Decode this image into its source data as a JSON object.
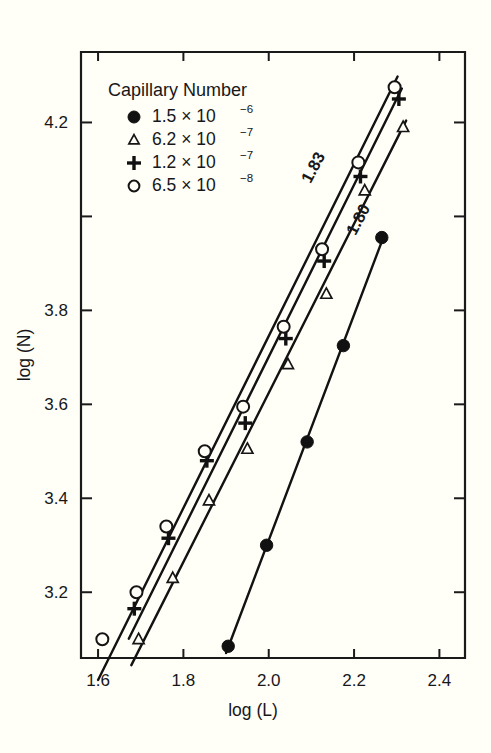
{
  "figure": {
    "background_color": "#fffef7",
    "ink_color": "#111111"
  },
  "legend": {
    "title": "Capillary Number",
    "position": "upper-left-inside",
    "entries": [
      {
        "marker": "filled-circle",
        "mantissa": "1.5 × 10",
        "exponent": "−6",
        "value": 1.5e-06
      },
      {
        "marker": "open-triangle",
        "mantissa": "6.2 × 10",
        "exponent": "−7",
        "value": 6.2e-07
      },
      {
        "marker": "plus",
        "mantissa": "1.2 × 10",
        "exponent": "−7",
        "value": 1.2e-07
      },
      {
        "marker": "open-circle",
        "mantissa": "6.5 × 10",
        "exponent": "−8",
        "value": 6.5e-08
      }
    ]
  },
  "annotations": [
    {
      "name": "slope-label-upper",
      "text": "1.83",
      "rotation_deg": -62
    },
    {
      "name": "slope-label-lower",
      "text": "1.80",
      "rotation_deg": -62
    }
  ],
  "chart_data": {
    "type": "scatter",
    "title": "",
    "xlabel": "log (L)",
    "ylabel": "log (N)",
    "xlim": [
      1.56,
      2.46
    ],
    "ylim": [
      3.06,
      4.35
    ],
    "xticks": [
      1.6,
      1.8,
      2.0,
      2.2,
      2.4
    ],
    "xticklabels": [
      "1.6",
      "1.8",
      "2.0",
      "2.2",
      "2.4"
    ],
    "yticks": [
      3.2,
      3.4,
      3.6,
      3.8,
      4.0,
      4.2
    ],
    "yticklabels": [
      "3.2",
      "3.4",
      "3.6",
      "3.8",
      "",
      "4.2"
    ],
    "grid": false,
    "legend_position": "upper left",
    "series": [
      {
        "name": "1.5 × 10−6",
        "marker": "filled-circle",
        "fit_slope": null,
        "points": [
          {
            "x": 1.905,
            "y": 3.085
          },
          {
            "x": 1.995,
            "y": 3.3
          },
          {
            "x": 2.09,
            "y": 3.52
          },
          {
            "x": 2.175,
            "y": 3.725
          },
          {
            "x": 2.265,
            "y": 3.955
          }
        ]
      },
      {
        "name": "6.2 × 10−7",
        "marker": "open-triangle",
        "fit_slope": 1.8,
        "points": [
          {
            "x": 1.695,
            "y": 3.1
          },
          {
            "x": 1.775,
            "y": 3.23
          },
          {
            "x": 1.86,
            "y": 3.395
          },
          {
            "x": 1.95,
            "y": 3.505
          },
          {
            "x": 2.045,
            "y": 3.685
          },
          {
            "x": 2.135,
            "y": 3.835
          },
          {
            "x": 2.225,
            "y": 4.055
          },
          {
            "x": 2.315,
            "y": 4.19
          }
        ]
      },
      {
        "name": "1.2 × 10−7",
        "marker": "plus",
        "fit_slope": 1.83,
        "points": [
          {
            "x": 1.685,
            "y": 3.165
          },
          {
            "x": 1.765,
            "y": 3.315
          },
          {
            "x": 1.855,
            "y": 3.48
          },
          {
            "x": 1.945,
            "y": 3.56
          },
          {
            "x": 2.04,
            "y": 3.74
          },
          {
            "x": 2.13,
            "y": 3.905
          },
          {
            "x": 2.215,
            "y": 4.085
          },
          {
            "x": 2.305,
            "y": 4.25
          }
        ]
      },
      {
        "name": "6.5 × 10−8",
        "marker": "open-circle",
        "fit_slope": 1.83,
        "points": [
          {
            "x": 1.61,
            "y": 3.1
          },
          {
            "x": 1.69,
            "y": 3.2
          },
          {
            "x": 1.76,
            "y": 3.34
          },
          {
            "x": 1.85,
            "y": 3.5
          },
          {
            "x": 1.94,
            "y": 3.595
          },
          {
            "x": 2.035,
            "y": 3.765
          },
          {
            "x": 2.125,
            "y": 3.93
          },
          {
            "x": 2.21,
            "y": 4.115
          },
          {
            "x": 2.295,
            "y": 4.275
          }
        ]
      }
    ],
    "fit_lines": [
      {
        "series": "6.5 × 10−8",
        "slope": 1.83,
        "x0": 1.6,
        "x1": 2.302
      },
      {
        "series": "1.2 × 10−7",
        "slope": 1.83,
        "x0": 1.672,
        "x1": 2.312
      },
      {
        "series": "6.2 × 10−7",
        "slope": 1.8,
        "x0": 1.678,
        "x1": 2.322
      },
      {
        "series": "1.5 × 10−6",
        "slope": 2.4,
        "x0": 1.9,
        "x1": 2.272
      }
    ]
  }
}
